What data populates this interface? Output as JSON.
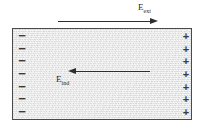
{
  "figure": {
    "background_color": "#ffffff",
    "slab": {
      "fill_color": "#e3e3e3",
      "border_color": "#4a4a4a",
      "material_label": ""
    },
    "labels": {
      "external_field": {
        "symbol": "E",
        "subscript": "ext"
      },
      "induced_field": {
        "symbol": "E",
        "subscript": "ind"
      }
    },
    "arrows": [
      {
        "name": "external-field-arrow",
        "direction": "right",
        "position": "above-slab"
      },
      {
        "name": "induced-field-arrow",
        "direction": "left",
        "position": "inside-slab"
      }
    ],
    "charges": {
      "left_edge": {
        "sign": "−",
        "count": 7
      },
      "right_edge": {
        "sign": "+",
        "count": 7
      }
    },
    "signs": {
      "minus": "−",
      "plus": "+"
    }
  }
}
